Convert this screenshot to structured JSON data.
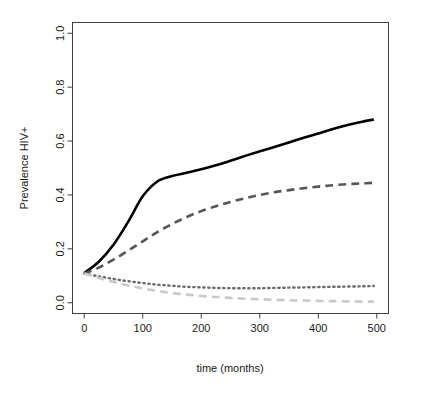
{
  "figure": {
    "background_color": "#ffffff",
    "width": 426,
    "height": 397
  },
  "chart_data": {
    "type": "line",
    "title": "",
    "xlabel": "time (months)",
    "ylabel": "Prevalence HIV+",
    "xlim": [
      0,
      500
    ],
    "ylim": [
      0.0,
      1.0
    ],
    "xticks": [
      0,
      100,
      200,
      300,
      400,
      500
    ],
    "xtick_labels": [
      "0",
      "100",
      "200",
      "300",
      "400",
      "500"
    ],
    "yticks": [
      0.0,
      0.2,
      0.4,
      0.6,
      0.8,
      1.0
    ],
    "ytick_labels": [
      "0.0",
      "0.2",
      "0.4",
      "0.6",
      "0.8",
      "1.0"
    ],
    "grid": false,
    "legend": "none",
    "x": [
      0,
      25,
      50,
      75,
      100,
      125,
      150,
      175,
      200,
      225,
      250,
      275,
      300,
      325,
      350,
      375,
      400,
      425,
      450,
      475,
      495
    ],
    "series": [
      {
        "name": "solid-black",
        "style": "solid",
        "color": "#000000",
        "width": 2.6,
        "values": [
          0.11,
          0.152,
          0.215,
          0.3,
          0.395,
          0.45,
          0.47,
          0.482,
          0.495,
          0.51,
          0.527,
          0.545,
          0.562,
          0.578,
          0.595,
          0.612,
          0.628,
          0.645,
          0.66,
          0.672,
          0.68
        ]
      },
      {
        "name": "dark-gray-dashed",
        "style": "dashed",
        "color": "#555555",
        "width": 2.6,
        "values": [
          0.108,
          0.13,
          0.16,
          0.193,
          0.228,
          0.262,
          0.292,
          0.318,
          0.34,
          0.358,
          0.374,
          0.388,
          0.4,
          0.41,
          0.418,
          0.425,
          0.431,
          0.436,
          0.44,
          0.443,
          0.445
        ]
      },
      {
        "name": "dark-gray-dotted",
        "style": "dotted",
        "color": "#6b6b6b",
        "width": 2.4,
        "values": [
          0.108,
          0.098,
          0.088,
          0.08,
          0.073,
          0.067,
          0.063,
          0.059,
          0.057,
          0.055,
          0.054,
          0.054,
          0.054,
          0.055,
          0.056,
          0.057,
          0.058,
          0.059,
          0.06,
          0.061,
          0.062
        ]
      },
      {
        "name": "light-gray-dashed",
        "style": "dashed",
        "color": "#c9c9c9",
        "width": 2.6,
        "values": [
          0.108,
          0.092,
          0.077,
          0.064,
          0.053,
          0.044,
          0.036,
          0.03,
          0.025,
          0.021,
          0.018,
          0.015,
          0.013,
          0.011,
          0.009,
          0.008,
          0.007,
          0.006,
          0.005,
          0.004,
          0.004
        ]
      }
    ]
  },
  "axes": {
    "x_title": "time (months)",
    "y_title": "Prevalence HIV+",
    "frame_color": "#3d3d3d",
    "tick_color": "#3d3d3d"
  }
}
